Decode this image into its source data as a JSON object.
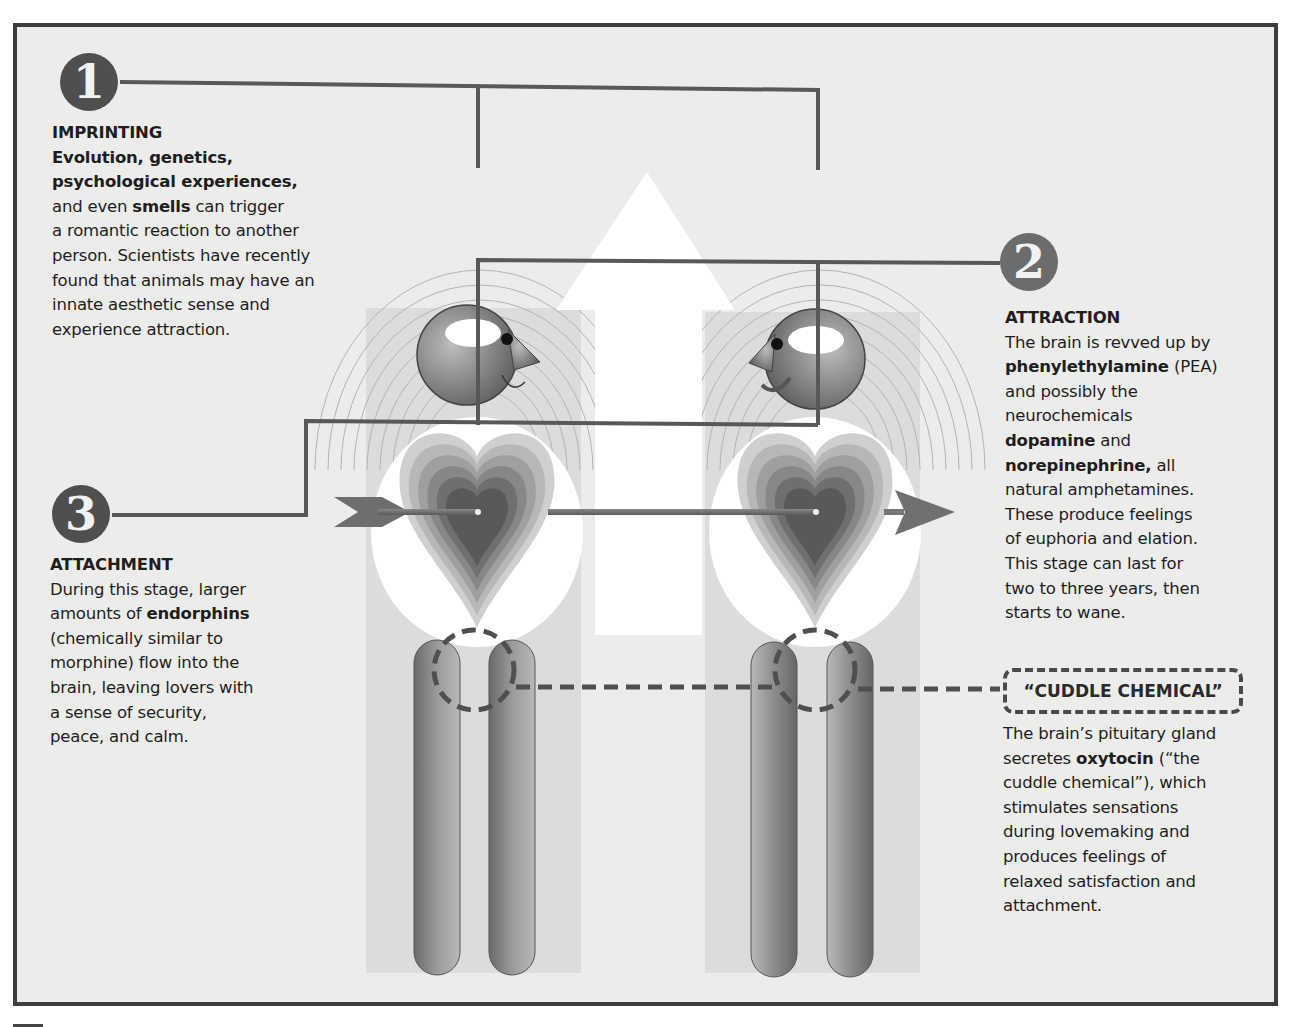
{
  "stages": [
    {
      "number": "1",
      "title": "IMPRINTING",
      "lines": [
        [
          {
            "t": "Evolution, genetics,",
            "b": true
          }
        ],
        [
          {
            "t": "psychological experiences,",
            "b": true
          }
        ],
        [
          {
            "t": "and even ",
            "b": false
          },
          {
            "t": "smells",
            "b": true
          },
          {
            "t": " can trigger",
            "b": false
          }
        ],
        [
          {
            "t": "a romantic reaction to another",
            "b": false
          }
        ],
        [
          {
            "t": "person. Scientists have recently",
            "b": false
          }
        ],
        [
          {
            "t": "found that animals may have an",
            "b": false
          }
        ],
        [
          {
            "t": "innate aesthetic sense and",
            "b": false
          }
        ],
        [
          {
            "t": "experience attraction.",
            "b": false
          }
        ]
      ]
    },
    {
      "number": "2",
      "title": "ATTRACTION",
      "lines": [
        [
          {
            "t": "The brain is revved up by",
            "b": false
          }
        ],
        [
          {
            "t": "phenylethylamine",
            "b": true
          },
          {
            "t": " (PEA)",
            "b": false
          }
        ],
        [
          {
            "t": "and possibly the",
            "b": false
          }
        ],
        [
          {
            "t": "neurochemicals",
            "b": false
          }
        ],
        [
          {
            "t": "dopamine",
            "b": true
          },
          {
            "t": " and",
            "b": false
          }
        ],
        [
          {
            "t": "norepinephrine,",
            "b": true
          },
          {
            "t": " all",
            "b": false
          }
        ],
        [
          {
            "t": "natural amphetamines.",
            "b": false
          }
        ],
        [
          {
            "t": "These produce feelings",
            "b": false
          }
        ],
        [
          {
            "t": "of euphoria and elation.",
            "b": false
          }
        ],
        [
          {
            "t": "This stage can last for",
            "b": false
          }
        ],
        [
          {
            "t": "two to three years, then",
            "b": false
          }
        ],
        [
          {
            "t": "starts to wane.",
            "b": false
          }
        ]
      ]
    },
    {
      "number": "3",
      "title": "ATTACHMENT",
      "lines": [
        [
          {
            "t": "During this stage, larger",
            "b": false
          }
        ],
        [
          {
            "t": "amounts of ",
            "b": false
          },
          {
            "t": "endorphins",
            "b": true
          }
        ],
        [
          {
            "t": "(chemically similar to",
            "b": false
          }
        ],
        [
          {
            "t": "morphine) flow into the",
            "b": false
          }
        ],
        [
          {
            "t": "brain, leaving lovers with",
            "b": false
          }
        ],
        [
          {
            "t": "a sense of security,",
            "b": false
          }
        ],
        [
          {
            "t": "peace, and calm.",
            "b": false
          }
        ]
      ]
    }
  ],
  "cuddle": {
    "title": "“CUDDLE CHEMICAL”",
    "lines": [
      [
        {
          "t": "The brain’s pituitary gland",
          "b": false
        }
      ],
      [
        {
          "t": "secretes ",
          "b": false
        },
        {
          "t": "oxytocin",
          "b": true
        },
        {
          "t": " (“the",
          "b": false
        }
      ],
      [
        {
          "t": "cuddle chemical”), which",
          "b": false
        }
      ],
      [
        {
          "t": "stimulates sensations",
          "b": false
        }
      ],
      [
        {
          "t": "during lovemaking and",
          "b": false
        }
      ],
      [
        {
          "t": "produces feelings of",
          "b": false
        }
      ],
      [
        {
          "t": "relaxed satisfaction and",
          "b": false
        }
      ],
      [
        {
          "t": "attachment.",
          "b": false
        }
      ]
    ]
  },
  "figures": [
    {
      "name": "left-person",
      "facing": "right",
      "icons": [
        "head-icon",
        "heart-icon",
        "legs-icon"
      ]
    },
    {
      "name": "right-person",
      "facing": "left",
      "icons": [
        "head-icon",
        "heart-icon",
        "legs-icon"
      ]
    }
  ],
  "colors": {
    "frame": "#3d3d3d",
    "background": "#ececea",
    "badge": "#4f4f4f",
    "connector": "#555555",
    "panel": "#dcdcda",
    "arrow": "#ffffff"
  }
}
